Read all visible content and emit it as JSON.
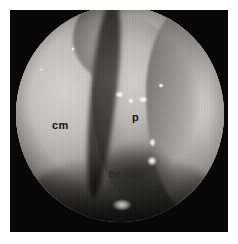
{
  "figure": {
    "kind": "endoscopic-photograph",
    "modality": "nasal endoscopy",
    "color_mode": "grayscale",
    "frame_color": "#070707",
    "page_background": "#ffffff",
    "field_of_view_shape": "circle"
  },
  "labels": [
    {
      "id": "cm",
      "text": "cm",
      "meaning": "concha media",
      "x": 42,
      "y": 110
    },
    {
      "id": "p",
      "text": "p",
      "meaning": "polyp",
      "x": 122,
      "y": 102
    },
    {
      "id": "be",
      "text": "be",
      "meaning": "bulla ethmoidalis",
      "x": 99,
      "y": 160
    }
  ],
  "highlights": [
    {
      "id": "highlight-upper-left",
      "x": 55,
      "y": 41,
      "w": 4,
      "h": 4
    },
    {
      "id": "highlight-cleft-upper",
      "x": 99,
      "y": 85,
      "w": 9,
      "h": 7
    },
    {
      "id": "highlight-cleft-mid",
      "x": 112,
      "y": 92,
      "w": 6,
      "h": 6
    },
    {
      "id": "highlight-cleft-right",
      "x": 122,
      "y": 90,
      "w": 10,
      "h": 7
    },
    {
      "id": "highlight-polyp-right",
      "x": 142,
      "y": 77,
      "w": 6,
      "h": 5
    },
    {
      "id": "highlight-bulla-a",
      "x": 133,
      "y": 132,
      "w": 7,
      "h": 9
    },
    {
      "id": "highlight-bulla-b",
      "x": 131,
      "y": 150,
      "w": 10,
      "h": 10
    },
    {
      "id": "highlight-floor",
      "x": 96,
      "y": 193,
      "w": 20,
      "h": 12
    },
    {
      "id": "highlight-left-edge",
      "x": 24,
      "y": 62,
      "w": 3,
      "h": 3
    }
  ]
}
